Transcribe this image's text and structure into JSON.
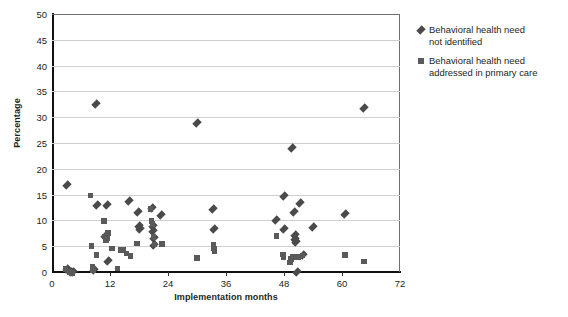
{
  "chart_data": {
    "type": "scatter",
    "title": "",
    "xlabel": "Implementation months",
    "ylabel": "Percentage",
    "xlim": [
      0,
      72
    ],
    "ylim": [
      0,
      50
    ],
    "xticks": [
      0,
      12,
      24,
      36,
      48,
      60,
      72
    ],
    "yticks": [
      0,
      5,
      10,
      15,
      20,
      25,
      30,
      35,
      40,
      45,
      50
    ],
    "grid": "horizontal",
    "legend_position": "right",
    "series": [
      {
        "name": "Behavioral health need not identified",
        "marker": "diamond",
        "color": "#4a4a4a",
        "points": [
          [
            3.0,
            0.5
          ],
          [
            4.0,
            0.0
          ],
          [
            4.4,
            0.0
          ],
          [
            8.6,
            0.3
          ],
          [
            9.0,
            32.6
          ],
          [
            9.4,
            13.0
          ],
          [
            3.2,
            16.9
          ],
          [
            11.4,
            13.0
          ],
          [
            11.6,
            2.2
          ],
          [
            11.0,
            7.0
          ],
          [
            16.0,
            13.8
          ],
          [
            17.8,
            11.7
          ],
          [
            18.0,
            9.0
          ],
          [
            18.2,
            8.4
          ],
          [
            20.6,
            12.4
          ],
          [
            20.8,
            9.0
          ],
          [
            20.9,
            8.0
          ],
          [
            21.0,
            6.6
          ],
          [
            21.1,
            5.2
          ],
          [
            22.6,
            11.1
          ],
          [
            30.0,
            28.9
          ],
          [
            33.4,
            12.2
          ],
          [
            33.6,
            8.3
          ],
          [
            46.4,
            10.1
          ],
          [
            48.0,
            14.7
          ],
          [
            48.1,
            8.4
          ],
          [
            49.6,
            24.0
          ],
          [
            50.0,
            11.6
          ],
          [
            50.2,
            7.2
          ],
          [
            50.3,
            6.3
          ],
          [
            50.4,
            5.8
          ],
          [
            50.6,
            0.0
          ],
          [
            51.4,
            13.3
          ],
          [
            52.0,
            3.2
          ],
          [
            54.0,
            8.8
          ],
          [
            60.6,
            11.3
          ],
          [
            64.6,
            31.8
          ]
        ]
      },
      {
        "name": "Behavioral health need addressed in primary care",
        "marker": "square",
        "color": "#5a5a5a",
        "points": [
          [
            2.8,
            0.6
          ],
          [
            3.6,
            0.0
          ],
          [
            4.2,
            -0.2
          ],
          [
            8.0,
            14.8
          ],
          [
            8.2,
            5.0
          ],
          [
            8.4,
            1.0
          ],
          [
            8.5,
            0.4
          ],
          [
            9.2,
            3.3
          ],
          [
            10.8,
            9.9
          ],
          [
            11.0,
            6.9
          ],
          [
            11.2,
            6.2
          ],
          [
            11.4,
            6.6
          ],
          [
            11.6,
            7.6
          ],
          [
            12.4,
            4.6
          ],
          [
            13.6,
            0.7
          ],
          [
            14.2,
            4.3
          ],
          [
            14.8,
            4.3
          ],
          [
            15.4,
            3.6
          ],
          [
            16.2,
            3.1
          ],
          [
            17.6,
            5.5
          ],
          [
            20.4,
            12.2
          ],
          [
            20.6,
            9.9
          ],
          [
            20.8,
            9.3
          ],
          [
            21.0,
            6.8
          ],
          [
            21.2,
            5.3
          ],
          [
            22.8,
            5.4
          ],
          [
            30.0,
            2.7
          ],
          [
            33.4,
            5.3
          ],
          [
            33.5,
            4.6
          ],
          [
            33.6,
            4.0
          ],
          [
            46.4,
            7.0
          ],
          [
            47.8,
            3.4
          ],
          [
            47.9,
            2.9
          ],
          [
            49.2,
            1.8
          ],
          [
            49.4,
            2.5
          ],
          [
            49.8,
            2.9
          ],
          [
            50.4,
            2.9
          ],
          [
            51.0,
            2.9
          ],
          [
            51.8,
            3.2
          ],
          [
            60.6,
            3.3
          ],
          [
            64.6,
            2.0
          ]
        ]
      }
    ]
  },
  "legend": {
    "items": [
      {
        "marker": "diamond",
        "line1": "Behavioral health need",
        "line2": "not identified"
      },
      {
        "marker": "square",
        "line1": "Behavioral health need",
        "line2": "addressed in primary care"
      }
    ]
  },
  "colors": {
    "diamond": "#4a4a4a",
    "square": "#5a5a5a",
    "grid": "#cfcfcf",
    "axis": "#111111",
    "text": "#231f20"
  }
}
